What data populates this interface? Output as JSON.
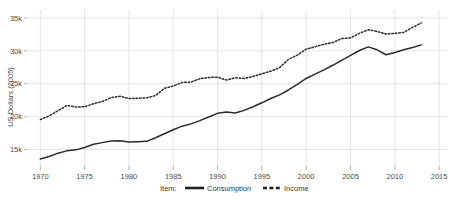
{
  "chart_data": {
    "type": "line",
    "title": "",
    "subtitle": "",
    "xlabel": "",
    "ylabel": "US Dollars (2005)",
    "xlim": [
      1968.5,
      2016
    ],
    "ylim": [
      12500,
      36200
    ],
    "grid": true,
    "legend_position": "bottom",
    "legend_title": "Item:",
    "x_ticks": [
      1970,
      1975,
      1980,
      1985,
      1990,
      1995,
      2000,
      2005,
      2010,
      2015
    ],
    "x_tick_labels": [
      "1970",
      "1975",
      "1980",
      "1985",
      "1990",
      "1995",
      "2000",
      "2005",
      "2010",
      "2015"
    ],
    "y_ticks": [
      15000,
      20000,
      25000,
      30000,
      35000
    ],
    "y_tick_labels": [
      "15k",
      "20k",
      "25k",
      "30k",
      "35k"
    ],
    "x": [
      1970,
      1971,
      1972,
      1973,
      1974,
      1975,
      1976,
      1977,
      1978,
      1979,
      1980,
      1981,
      1982,
      1983,
      1984,
      1985,
      1986,
      1987,
      1988,
      1989,
      1990,
      1991,
      1992,
      1993,
      1994,
      1995,
      1996,
      1997,
      1998,
      1999,
      2000,
      2001,
      2002,
      2003,
      2004,
      2005,
      2006,
      2007,
      2008,
      2009,
      2010,
      2011,
      2012,
      2013
    ],
    "series": [
      {
        "name": "Consumption",
        "style": "solid",
        "color": "#2b2b2b",
        "values": [
          13550,
          13950,
          14450,
          14800,
          14950,
          15300,
          15800,
          16050,
          16300,
          16350,
          16150,
          16200,
          16250,
          16800,
          17400,
          18000,
          18550,
          18900,
          19400,
          19950,
          20500,
          20700,
          20550,
          20950,
          21500,
          22100,
          22750,
          23300,
          24050,
          24900,
          25800,
          26450,
          27100,
          27800,
          28550,
          29300,
          30050,
          30600,
          30150,
          29400,
          29750,
          30150,
          30500,
          30900
        ]
      },
      {
        "name": "Income",
        "style": "dashed",
        "color": "#2b2b2b",
        "values": [
          19550,
          20100,
          20900,
          21700,
          21450,
          21500,
          21950,
          22300,
          22900,
          23100,
          22750,
          22800,
          22850,
          23200,
          24300,
          24650,
          25200,
          25250,
          25750,
          25950,
          26000,
          25550,
          25900,
          25800,
          26100,
          26500,
          26900,
          27450,
          28700,
          29350,
          30250,
          30600,
          31000,
          31250,
          31850,
          31950,
          32650,
          33200,
          32950,
          32550,
          32650,
          32800,
          33550,
          34250
        ]
      }
    ]
  },
  "legend": {
    "title": "Item:",
    "entries": [
      {
        "label": "Consumption",
        "style": "solid"
      },
      {
        "label": "Income",
        "style": "dashed"
      }
    ]
  },
  "axes": {
    "y_title": "US Dollars (2005)"
  }
}
